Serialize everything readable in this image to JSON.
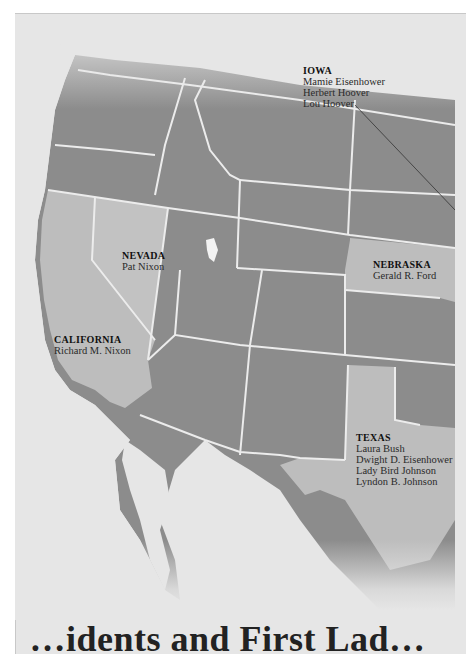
{
  "map": {
    "colors": {
      "background": "#e6e6e6",
      "other_states": "#8c8c8c",
      "highlighted_states": "#bdbdbd",
      "mexico": "#8a8a8a",
      "borders": "#ededed",
      "leader_line": "#333333"
    },
    "labels": [
      {
        "state": "IOWA",
        "names": [
          "Mamie Eisenhower",
          "Herbert Hoover",
          "Lou Hoover"
        ]
      },
      {
        "state": "NEVADA",
        "names": [
          "Pat Nixon"
        ]
      },
      {
        "state": "NEBRASKA",
        "names": [
          "Gerald R. Ford"
        ]
      },
      {
        "state": "CALIFORNIA",
        "names": [
          "Richard M. Nixon"
        ]
      },
      {
        "state": "TEXAS",
        "names": [
          "Laura Bush",
          "Dwight D. Eisenhower",
          "Lady Bird Johnson",
          "Lyndon B. Johnson"
        ]
      }
    ]
  },
  "footer": {
    "title_partial": "…idents and First Lad…"
  }
}
